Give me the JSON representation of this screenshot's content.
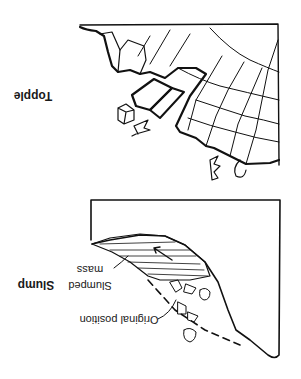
{
  "figure": {
    "orientation": "rotated 180 degrees",
    "panels": [
      {
        "id": "topple",
        "title": "Topple",
        "description": "Jointed rock blocks toppling from a cliff face onto a house and trees below"
      },
      {
        "id": "slump",
        "title": "Slump",
        "labels": {
          "slumped_mass": [
            "Slumped",
            "mass"
          ],
          "original_position": "Original position"
        },
        "description": "Rotational slump of a hatched soil mass with a dashed line showing original slope position, house and trees carried down"
      }
    ],
    "colors": {
      "ink": "#111111",
      "background": "#ffffff"
    }
  }
}
